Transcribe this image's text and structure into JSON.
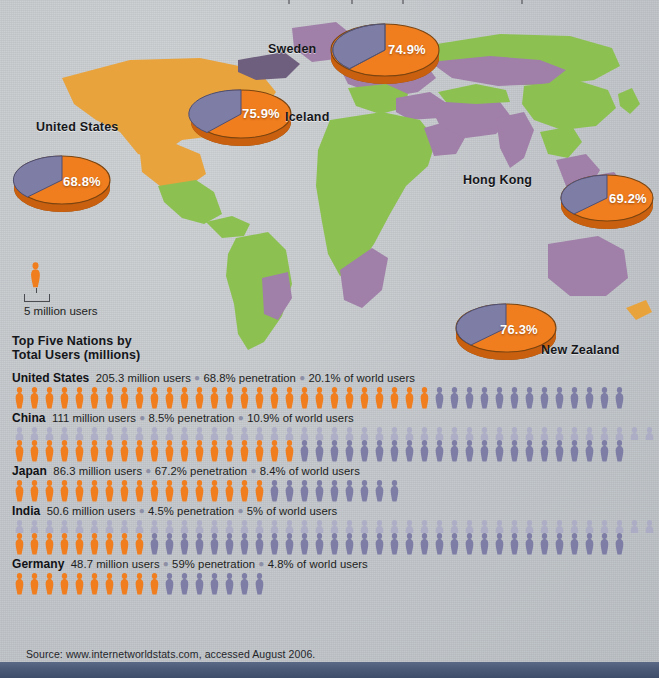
{
  "meta": {
    "background_color": "#c3c7ca",
    "orange": "#f07d1e",
    "purple": "#7d7da6",
    "purple_faded": "#a9a9c6",
    "bottom_bar_color": "#4c5c78"
  },
  "pies": [
    {
      "name": "United States",
      "label": "United States",
      "percent_text": "68.8%",
      "percent": 68.8
    },
    {
      "name": "Iceland",
      "label": "Iceland",
      "percent_text": "75.9%",
      "percent": 75.9
    },
    {
      "name": "Sweden",
      "label": "Sweden",
      "percent_text": "74.9%",
      "percent": 74.9
    },
    {
      "name": "Hong Kong",
      "label": "Hong Kong",
      "percent_text": "69.2%",
      "percent": 69.2
    },
    {
      "name": "New Zealand",
      "label": "New Zealand",
      "percent_text": "76.3%",
      "percent": 76.3
    }
  ],
  "legend": {
    "caption": "5 million users",
    "unit_millions": 5
  },
  "chart": {
    "title_line1": "Top Five Nations by",
    "title_line2": "Total Users (millions)"
  },
  "source": {
    "text": "Source: www.internetworldstats.com, accessed August 2006."
  },
  "chart_data": {
    "type": "bar",
    "title": "Top Five Nations by Total Users (millions)",
    "xlabel": "",
    "ylabel": "Internet users (millions)",
    "unit_per_icon_millions": 5,
    "legend": [
      "5 million users"
    ],
    "categories": [
      "United States",
      "China",
      "Japan",
      "India",
      "Germany"
    ],
    "values": [
      205.3,
      111,
      86.3,
      50.6,
      48.7
    ],
    "series": [
      {
        "name": "Total users (millions)",
        "values": [
          205.3,
          111,
          86.3,
          50.6,
          48.7
        ]
      },
      {
        "name": "Penetration (%)",
        "values": [
          68.8,
          8.5,
          67.2,
          4.5,
          59
        ]
      },
      {
        "name": "Share of world users (%)",
        "values": [
          20.1,
          10.9,
          8.4,
          5,
          4.8
        ]
      }
    ],
    "rows": [
      {
        "country": "United States",
        "users_text": "205.3 million users",
        "penetration_text": "68.8% penetration",
        "world_share_text": "20.1% of world users",
        "users_millions": 205.3,
        "penetration_pct": 68.8,
        "world_share_pct": 20.1,
        "icons_orange": 28,
        "icons_purple": 13,
        "icon_rows": 1
      },
      {
        "country": "China",
        "users_text": "111 million users",
        "penetration_text": "8.5% penetration",
        "world_share_text": "10.9% of world users",
        "users_millions": 111,
        "penetration_pct": 8.5,
        "world_share_pct": 10.9,
        "icons_orange": 19,
        "icons_purple": 22,
        "icons_faded": 43,
        "icon_rows": 2
      },
      {
        "country": "Japan",
        "users_text": "86.3 million users",
        "penetration_text": "67.2% penetration",
        "world_share_text": "8.4% of world users",
        "users_millions": 86.3,
        "penetration_pct": 67.2,
        "world_share_pct": 8.4,
        "icons_orange": 17,
        "icons_purple": 9,
        "icon_rows": 1
      },
      {
        "country": "India",
        "users_text": "50.6 million users",
        "penetration_text": "4.5% penetration",
        "world_share_text": "5% of world users",
        "users_millions": 50.6,
        "penetration_pct": 4.5,
        "world_share_pct": 5,
        "icons_orange": 9,
        "icons_purple": 32,
        "icons_faded": 43,
        "icon_rows": 2
      },
      {
        "country": "Germany",
        "users_text": "48.7 million users",
        "penetration_text": "59% penetration",
        "world_share_text": "4.8% of world users",
        "users_millions": 48.7,
        "penetration_pct": 59,
        "world_share_pct": 4.8,
        "icons_orange": 10,
        "icons_purple": 7,
        "icon_rows": 1
      }
    ]
  }
}
